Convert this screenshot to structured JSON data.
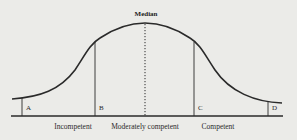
{
  "diagram": {
    "title": "Median",
    "points": {
      "a": "A",
      "b": "B",
      "c": "C",
      "d": "D"
    },
    "regions": [
      {
        "label": "Incompetent"
      },
      {
        "label": "Moderately competent"
      },
      {
        "label": "Competent"
      }
    ],
    "colors": {
      "background": "#ebebe8",
      "ink": "#2a2a2a"
    }
  }
}
